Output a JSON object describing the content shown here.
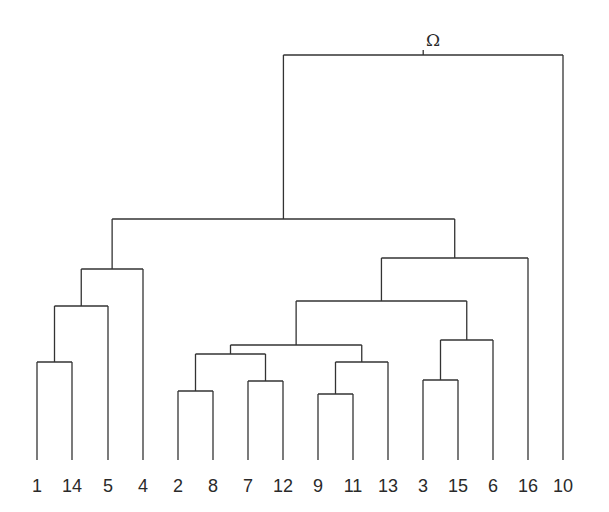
{
  "title": "",
  "root_label": "Ω",
  "root_label_pos": [
    433,
    46
  ],
  "line_color": "#333333",
  "leaf_baseline_y": 460,
  "leaf_label_y": 492,
  "leaves": [
    {
      "label": "1",
      "x": 37
    },
    {
      "label": "14",
      "x": 72
    },
    {
      "label": "5",
      "x": 108
    },
    {
      "label": "4",
      "x": 143
    },
    {
      "label": "2",
      "x": 178
    },
    {
      "label": "8",
      "x": 213
    },
    {
      "label": "7",
      "x": 248
    },
    {
      "label": "12",
      "x": 283
    },
    {
      "label": "9",
      "x": 318
    },
    {
      "label": "11",
      "x": 353
    },
    {
      "label": "13",
      "x": 388
    },
    {
      "label": "3",
      "x": 423
    },
    {
      "label": "15",
      "x": 458
    },
    {
      "label": "6",
      "x": 493
    },
    {
      "label": "16",
      "x": 528
    },
    {
      "label": "10",
      "x": 563
    }
  ],
  "merges": [
    {
      "id": "m1",
      "left": "1",
      "right": "14",
      "y": 362
    },
    {
      "id": "m2",
      "left": "m1",
      "right": "5",
      "y": 306
    },
    {
      "id": "m3",
      "left": "m2",
      "right": "4",
      "y": 269
    },
    {
      "id": "m4",
      "left": "2",
      "right": "8",
      "y": 391
    },
    {
      "id": "m5",
      "left": "7",
      "right": "12",
      "y": 381
    },
    {
      "id": "m6",
      "left": "m4",
      "right": "m5",
      "y": 354
    },
    {
      "id": "m7",
      "left": "9",
      "right": "11",
      "y": 394
    },
    {
      "id": "m8",
      "left": "m7",
      "right": "13",
      "y": 362
    },
    {
      "id": "m9",
      "left": "m6",
      "right": "m8",
      "y": 345
    },
    {
      "id": "m10",
      "left": "3",
      "right": "15",
      "y": 380
    },
    {
      "id": "m11",
      "left": "m10",
      "right": "6",
      "y": 340
    },
    {
      "id": "m12",
      "left": "m9",
      "right": "m11",
      "y": 301
    },
    {
      "id": "m13",
      "left": "m12",
      "right": "16",
      "y": 258
    },
    {
      "id": "m14",
      "left": "m3",
      "right": "m13",
      "y": 219
    },
    {
      "id": "m15",
      "left": "m14",
      "right": "10",
      "y": 55
    }
  ],
  "root_tick_height": 5
}
